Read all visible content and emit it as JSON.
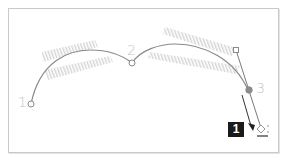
{
  "diagram": {
    "type": "bezier-pen-tool-illustration",
    "anchor_labels": [
      "1",
      "2",
      "3"
    ],
    "step_badge": "1",
    "colors": {
      "path": "#8a8a8a",
      "anchor_fill": "#ffffff",
      "anchor_selected_fill": "#8c8c8c",
      "hatch": "#d6d6d6",
      "label": "#c4c4c4",
      "badge_bg": "#1a1a1a",
      "badge_text": "#ffffff"
    },
    "icons": [
      "pen-cursor-icon",
      "drag-arrow-icon",
      "direction-handle-icon"
    ]
  }
}
